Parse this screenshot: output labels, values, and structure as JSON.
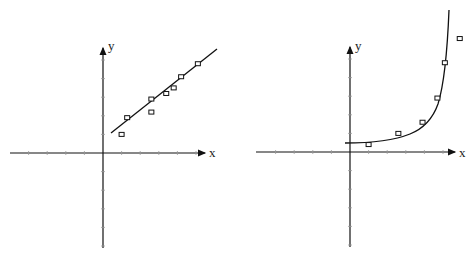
{
  "chart_data": [
    {
      "type": "scatter",
      "title": "",
      "xlabel": "x",
      "ylabel": "y",
      "grid": false,
      "fit": "linear",
      "series": [
        {
          "name": "data points",
          "x": [
            1.0,
            1.3,
            2.6,
            2.6,
            3.4,
            3.8,
            4.2,
            5.1
          ],
          "y": [
            1.0,
            1.9,
            2.9,
            2.2,
            3.2,
            3.5,
            4.1,
            4.8
          ]
        },
        {
          "name": "linear fit",
          "x": [
            0.4,
            6.1
          ],
          "y": [
            1.1,
            5.6
          ]
        }
      ],
      "xlim": [
        -5,
        5.5
      ],
      "ylim": [
        -5,
        5.8
      ]
    },
    {
      "type": "scatter",
      "title": "",
      "xlabel": "x",
      "ylabel": "y",
      "grid": false,
      "fit": "exponential",
      "series": [
        {
          "name": "data points",
          "x": [
            1.0,
            2.6,
            3.9,
            4.7,
            5.1,
            5.9
          ],
          "y": [
            0.4,
            1.0,
            1.6,
            2.9,
            4.8,
            6.1
          ]
        },
        {
          "name": "exponential fit",
          "x": [
            -0.2,
            1.0,
            2.0,
            3.0,
            3.9,
            4.5,
            5.0,
            5.3,
            5.5
          ],
          "y": [
            0.5,
            0.55,
            0.75,
            1.1,
            1.6,
            2.4,
            3.8,
            5.5,
            7.5
          ]
        }
      ],
      "xlim": [
        -5,
        5.5
      ],
      "ylim": [
        -5,
        5.8
      ]
    }
  ],
  "labels": {
    "left_x": "x",
    "left_y": "y",
    "right_x": "x",
    "right_y": "y"
  }
}
